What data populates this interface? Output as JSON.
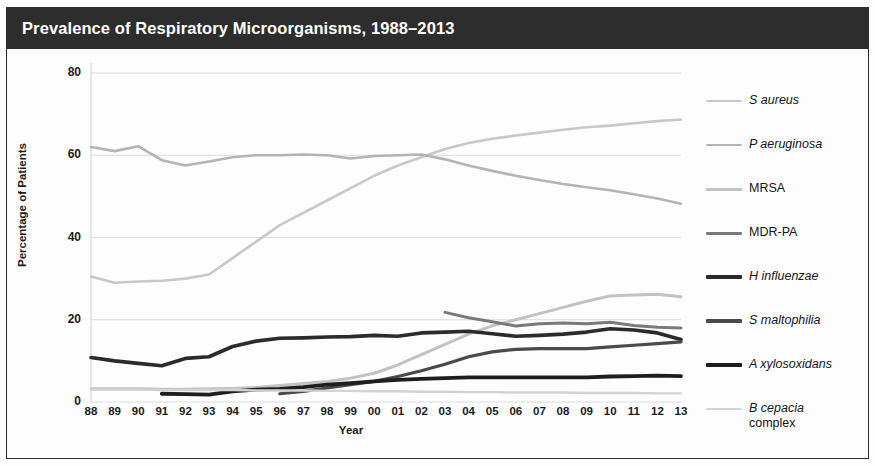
{
  "title": "Prevalence of Respiratory Microorganisms, 1988–2013",
  "axes": {
    "ylabel": "Percentage of Patients",
    "xlabel": "Year",
    "yticks": [
      "0",
      "20",
      "40",
      "60",
      "80"
    ],
    "xticks": [
      "88",
      "89",
      "90",
      "91",
      "92",
      "93",
      "94",
      "95",
      "96",
      "97",
      "98",
      "99",
      "00",
      "01",
      "02",
      "03",
      "04",
      "05",
      "06",
      "07",
      "08",
      "09",
      "10",
      "11",
      "12",
      "13"
    ]
  },
  "legend": [
    {
      "label": "S aureus",
      "color": "#c8c8c8",
      "italic": true,
      "width": 2.6
    },
    {
      "label": "P aeruginosa",
      "color": "#b4b4b4",
      "italic": true,
      "width": 2.6
    },
    {
      "label": "MRSA",
      "color": "#c2c2c2",
      "italic": false,
      "width": 3.0
    },
    {
      "label": "MDR-PA",
      "color": "#7a7a7a",
      "italic": false,
      "width": 3.0
    },
    {
      "label": "H influenzae",
      "color": "#2b2b2b",
      "italic": true,
      "width": 3.6
    },
    {
      "label": "S maltophilia",
      "color": "#4a4a4a",
      "italic": true,
      "width": 3.2
    },
    {
      "label": "A xylosoxidans",
      "color": "#1e1e1e",
      "italic": true,
      "width": 3.8
    },
    {
      "label": "B cepacia\ncomplex",
      "color": "#d2d2d2",
      "italic": true,
      "width": 2.4
    }
  ],
  "chart_data": {
    "type": "line",
    "title": "Prevalence of Respiratory Microorganisms, 1988–2013",
    "xlabel": "Year",
    "ylabel": "Percentage of Patients",
    "ylim": [
      0,
      80
    ],
    "grid": true,
    "legend_position": "right",
    "x": [
      "88",
      "89",
      "90",
      "91",
      "92",
      "93",
      "94",
      "95",
      "96",
      "97",
      "98",
      "99",
      "00",
      "01",
      "02",
      "03",
      "04",
      "05",
      "06",
      "07",
      "08",
      "09",
      "10",
      "11",
      "12",
      "13"
    ],
    "series": [
      {
        "name": "S aureus",
        "color": "#c8c8c8",
        "values": [
          30.5,
          29.0,
          29.3,
          29.5,
          30.0,
          31.0,
          35.0,
          39.0,
          43.0,
          46.0,
          49.0,
          52.0,
          55.0,
          57.5,
          59.5,
          61.5,
          63.0,
          64.0,
          64.8,
          65.5,
          66.2,
          66.8,
          67.2,
          67.8,
          68.3,
          68.7
        ]
      },
      {
        "name": "P aeruginosa",
        "color": "#b4b4b4",
        "values": [
          62.0,
          61.0,
          62.2,
          58.8,
          57.5,
          58.5,
          59.5,
          60.0,
          60.0,
          60.2,
          60.0,
          59.2,
          59.8,
          60.0,
          60.2,
          59.0,
          57.5,
          56.2,
          55.0,
          54.0,
          53.0,
          52.2,
          51.5,
          50.5,
          49.5,
          48.2
        ]
      },
      {
        "name": "MRSA",
        "color": "#c2c2c2",
        "values": [
          3.2,
          3.2,
          3.2,
          3.1,
          3.1,
          3.2,
          3.3,
          3.5,
          4.0,
          4.5,
          5.0,
          5.8,
          7.0,
          9.0,
          11.5,
          14.0,
          16.5,
          18.5,
          20.0,
          21.5,
          23.0,
          24.5,
          25.8,
          26.0,
          26.2,
          25.6
        ]
      },
      {
        "name": "MDR-PA",
        "color": "#7a7a7a",
        "values": [
          null,
          null,
          null,
          null,
          null,
          null,
          null,
          null,
          null,
          null,
          null,
          null,
          null,
          null,
          null,
          21.8,
          20.5,
          19.5,
          18.5,
          19.0,
          19.2,
          19.0,
          19.4,
          18.6,
          18.2,
          18.0
        ]
      },
      {
        "name": "H influenzae",
        "color": "#2b2b2b",
        "values": [
          10.8,
          10.0,
          9.4,
          8.8,
          10.6,
          11.0,
          13.5,
          14.8,
          15.5,
          15.6,
          15.8,
          15.9,
          16.2,
          16.0,
          16.8,
          17.0,
          17.2,
          16.6,
          16.0,
          16.2,
          16.5,
          17.0,
          17.8,
          17.5,
          16.8,
          15.2
        ]
      },
      {
        "name": "S maltophilia",
        "color": "#4a4a4a",
        "values": [
          null,
          null,
          null,
          null,
          null,
          null,
          null,
          null,
          2.0,
          2.6,
          3.4,
          4.2,
          5.0,
          6.2,
          7.6,
          9.2,
          11.0,
          12.2,
          12.8,
          13.0,
          13.0,
          13.0,
          13.4,
          13.8,
          14.2,
          14.6
        ]
      },
      {
        "name": "A xylosoxidans",
        "color": "#1e1e1e",
        "values": [
          null,
          null,
          null,
          2.0,
          1.9,
          1.8,
          2.6,
          3.0,
          3.2,
          3.6,
          4.2,
          4.6,
          5.0,
          5.4,
          5.6,
          5.8,
          6.0,
          6.0,
          6.0,
          6.0,
          6.0,
          6.0,
          6.2,
          6.3,
          6.4,
          6.3
        ]
      },
      {
        "name": "B cepacia complex",
        "color": "#d2d2d2",
        "values": [
          3.0,
          3.0,
          3.0,
          2.9,
          2.9,
          2.9,
          2.9,
          2.8,
          2.8,
          2.8,
          2.7,
          2.7,
          2.6,
          2.6,
          2.5,
          2.5,
          2.4,
          2.4,
          2.3,
          2.3,
          2.3,
          2.2,
          2.2,
          2.2,
          2.1,
          2.1
        ]
      }
    ]
  }
}
